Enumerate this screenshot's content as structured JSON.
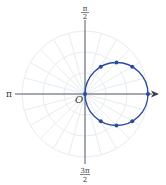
{
  "chart_data": {
    "type": "polar",
    "title": "",
    "curve": {
      "equation": "r = 2a cos(theta)",
      "description": "circle through the pole, centered on the polar axis",
      "color": "#2a4a9a",
      "points_polar": [
        {
          "theta_deg": 0,
          "r": 1.0
        },
        {
          "theta_deg": 30,
          "r": 0.866
        },
        {
          "theta_deg": 45,
          "r": 0.707
        },
        {
          "theta_deg": 60,
          "r": 0.5
        },
        {
          "theta_deg": 90,
          "r": 0.0
        },
        {
          "theta_deg": -30,
          "r": 0.866
        },
        {
          "theta_deg": -45,
          "r": 0.707
        },
        {
          "theta_deg": -60,
          "r": 0.5
        }
      ]
    },
    "grid": {
      "on": true,
      "rings": 3,
      "ray_step_deg": 15,
      "color": "#e8ecef"
    },
    "axis_labels": {
      "top": {
        "num": "π",
        "den": "2"
      },
      "left": "π",
      "bottom": {
        "num": "3π",
        "den": "2"
      },
      "origin": "O"
    }
  },
  "colors": {
    "curve": "#2a4a9a",
    "axis": "#555a66",
    "grid": "#e8ecef",
    "text": "#333333"
  }
}
